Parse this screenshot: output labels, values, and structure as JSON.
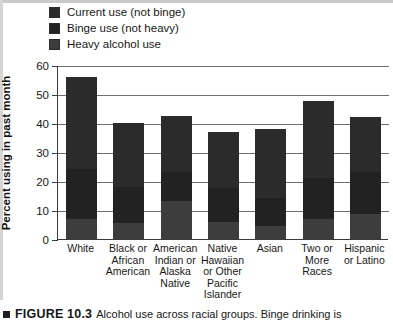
{
  "legend": {
    "items": [
      {
        "label": "Current use (not binge)",
        "color": "#2b2b2b",
        "key": "current"
      },
      {
        "label": "Binge use (not heavy)",
        "color": "#222222",
        "key": "binge"
      },
      {
        "label": "Heavy alcohol use",
        "color": "#3d3d3d",
        "key": "heavy"
      }
    ]
  },
  "axes": {
    "ylabel": "Percent using in past month",
    "yticks": [
      0,
      10,
      20,
      30,
      40,
      50,
      60
    ],
    "ymin": 0,
    "ymax": 60
  },
  "caption": {
    "bullet": "square-bullet",
    "label": "FIGURE 10.3",
    "text": "Alcohol use across racial groups. Binge drinking is"
  },
  "chart_data": {
    "type": "bar",
    "stacked": true,
    "title": "",
    "xlabel": "",
    "ylabel": "Percent using in past month",
    "ylim": [
      0,
      60
    ],
    "yticks": [
      0,
      10,
      20,
      30,
      40,
      50,
      60
    ],
    "grid": true,
    "legend_position": "top-left",
    "categories": [
      "White",
      "Black or African American",
      "American Indian or Alaska Native",
      "Native Hawaiian or Other Pacific Islander",
      "Asian",
      "Two or More Races",
      "Hispanic or Latino"
    ],
    "series": [
      {
        "name": "Heavy alcohol use",
        "values": [
          7.0,
          5.5,
          13.0,
          6.0,
          4.5,
          7.0,
          8.5
        ]
      },
      {
        "name": "Binge use (not heavy)",
        "values": [
          17.0,
          12.5,
          10.0,
          11.5,
          9.5,
          14.0,
          14.5
        ]
      },
      {
        "name": "Current use (not binge)",
        "values": [
          32.0,
          22.0,
          19.5,
          19.5,
          23.8,
          26.5,
          19.0
        ]
      }
    ],
    "totals": [
      56.0,
      40.0,
      42.5,
      37.0,
      37.8,
      47.5,
      42.0
    ],
    "cumulative_boundaries": {
      "heavy_top": [
        7.0,
        5.5,
        13.0,
        6.0,
        4.5,
        7.0,
        8.5
      ],
      "binge_top": [
        24.0,
        18.0,
        23.0,
        17.5,
        14.0,
        21.0,
        23.0
      ],
      "bar_top": [
        56.0,
        40.0,
        42.5,
        37.0,
        37.8,
        47.5,
        42.0
      ]
    }
  }
}
